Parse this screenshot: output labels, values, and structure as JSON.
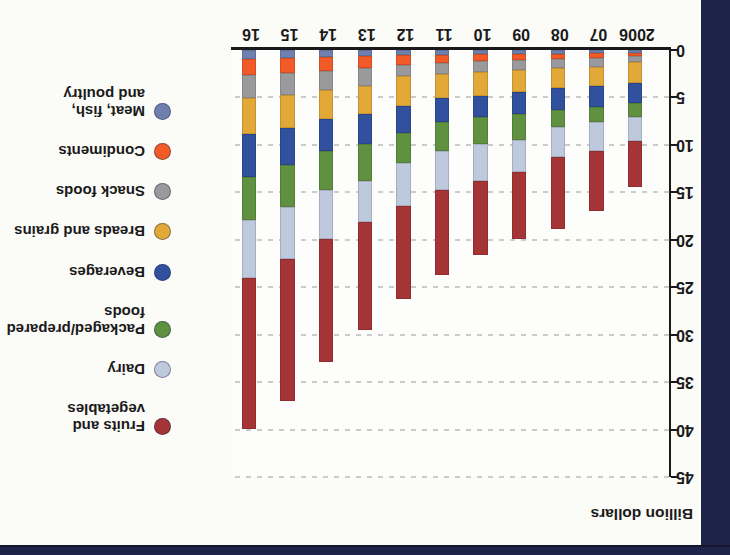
{
  "frame": {
    "border_color": "#1d2349",
    "page_background": "#fbfbf8",
    "note_orientation": "chart appears rotated 180 degrees in the photo"
  },
  "chart_data": {
    "type": "bar",
    "stacked": true,
    "title": "",
    "ylabel": "Billion dollars",
    "xlabel": "",
    "categories": [
      "2006",
      "07",
      "08",
      "09",
      "10",
      "11",
      "12",
      "13",
      "14",
      "15",
      "16"
    ],
    "ylim": [
      0,
      45
    ],
    "yticks": [
      0,
      5,
      10,
      15,
      20,
      25,
      30,
      35,
      40,
      45
    ],
    "grid": "horizontal dashed lines every 5 billion",
    "legend_position": "right",
    "totals": [
      14.4,
      17.0,
      18.9,
      19.9,
      21.6,
      23.7,
      26.2,
      29.5,
      32.9,
      37.0,
      40.0
    ],
    "series": [
      {
        "name": "Meat, fish, and poultry",
        "slug": "meat-fish-and-poultry",
        "legend_lines": [
          "Meat, fish,",
          "and poultry"
        ],
        "color": "#6f80ae",
        "values": [
          0.3,
          0.35,
          0.4,
          0.4,
          0.4,
          0.5,
          0.5,
          0.65,
          0.75,
          0.8,
          0.9
        ]
      },
      {
        "name": "Condiments",
        "slug": "condiments",
        "legend_lines": [
          "Condiments"
        ],
        "color": "#f25a28",
        "values": [
          0.3,
          0.45,
          0.5,
          0.7,
          0.8,
          0.9,
          1.1,
          1.25,
          1.45,
          1.6,
          1.75
        ]
      },
      {
        "name": "Snack foods",
        "slug": "snack-foods",
        "legend_lines": [
          "Snack foods"
        ],
        "color": "#9a9a9c",
        "values": [
          0.7,
          1.0,
          1.0,
          1.0,
          1.1,
          1.1,
          1.15,
          1.9,
          2.0,
          2.3,
          2.4
        ]
      },
      {
        "name": "Breads and grains",
        "slug": "breads-and-grains",
        "legend_lines": [
          "Breads and grains"
        ],
        "color": "#e2a838",
        "values": [
          2.2,
          2.0,
          2.1,
          2.3,
          2.5,
          2.6,
          3.15,
          2.95,
          3.1,
          3.5,
          3.85
        ]
      },
      {
        "name": "Beverages",
        "slug": "beverages",
        "legend_lines": [
          "Beverages"
        ],
        "color": "#31519f",
        "values": [
          2.1,
          2.2,
          2.3,
          2.3,
          2.3,
          2.5,
          2.85,
          3.15,
          3.4,
          3.9,
          4.5
        ]
      },
      {
        "name": "Packaged/prepared foods",
        "slug": "packaged-prepared-foods",
        "legend_lines": [
          "Packaged/prepared",
          "foods"
        ],
        "color": "#5f9140",
        "values": [
          1.5,
          1.6,
          1.8,
          2.8,
          2.8,
          3.0,
          3.15,
          3.9,
          4.1,
          4.4,
          4.5
        ]
      },
      {
        "name": "Dairy",
        "slug": "dairy",
        "legend_lines": [
          "Dairy"
        ],
        "color": "#bfc9de",
        "values": [
          2.5,
          3.0,
          3.2,
          3.4,
          3.9,
          4.2,
          4.6,
          4.3,
          5.1,
          5.5,
          6.1
        ]
      },
      {
        "name": "Fruits and vegetables",
        "slug": "fruits-and-vegetables",
        "legend_lines": [
          "Fruits and vegetables"
        ],
        "color": "#a53437",
        "values": [
          4.8,
          6.4,
          7.6,
          7.0,
          7.8,
          8.9,
          9.7,
          11.4,
          13.0,
          15.0,
          16.0
        ]
      }
    ]
  }
}
